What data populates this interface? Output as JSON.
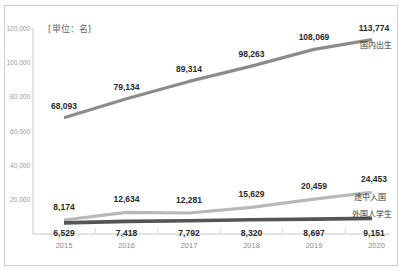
{
  "chart_data": {
    "type": "line",
    "title": "",
    "unit_label": "[単位：名]",
    "xlabel": "",
    "ylabel": "",
    "x": [
      "2015",
      "2016",
      "2017",
      "2018",
      "2019",
      "2020"
    ],
    "ylim": [
      0,
      120000
    ],
    "yticks": [
      "20,000",
      "40,000",
      "60,000",
      "80,000",
      "100,000",
      "120,000"
    ],
    "grid": false,
    "series": [
      {
        "name": "国内出生",
        "values": [
          68093,
          79134,
          89314,
          98263,
          108069,
          113774
        ],
        "labels": [
          "68,093",
          "79,134",
          "89,314",
          "98,263",
          "108,069",
          "113,774"
        ],
        "color": "#8c8c8c"
      },
      {
        "name": "途中入国",
        "values": [
          8174,
          12634,
          12281,
          15629,
          20459,
          24453
        ],
        "labels": [
          "8,174",
          "12,634",
          "12,281",
          "15,629",
          "20,459",
          "24,453"
        ],
        "color": "#b8b8b8"
      },
      {
        "name": "外国人学生",
        "values": [
          6529,
          7418,
          7792,
          8320,
          8697,
          9151
        ],
        "labels": [
          "6,529",
          "7,418",
          "7,792",
          "8,320",
          "8,697",
          "9,151"
        ],
        "color": "#555555"
      }
    ],
    "legend_position": "inline-right"
  }
}
